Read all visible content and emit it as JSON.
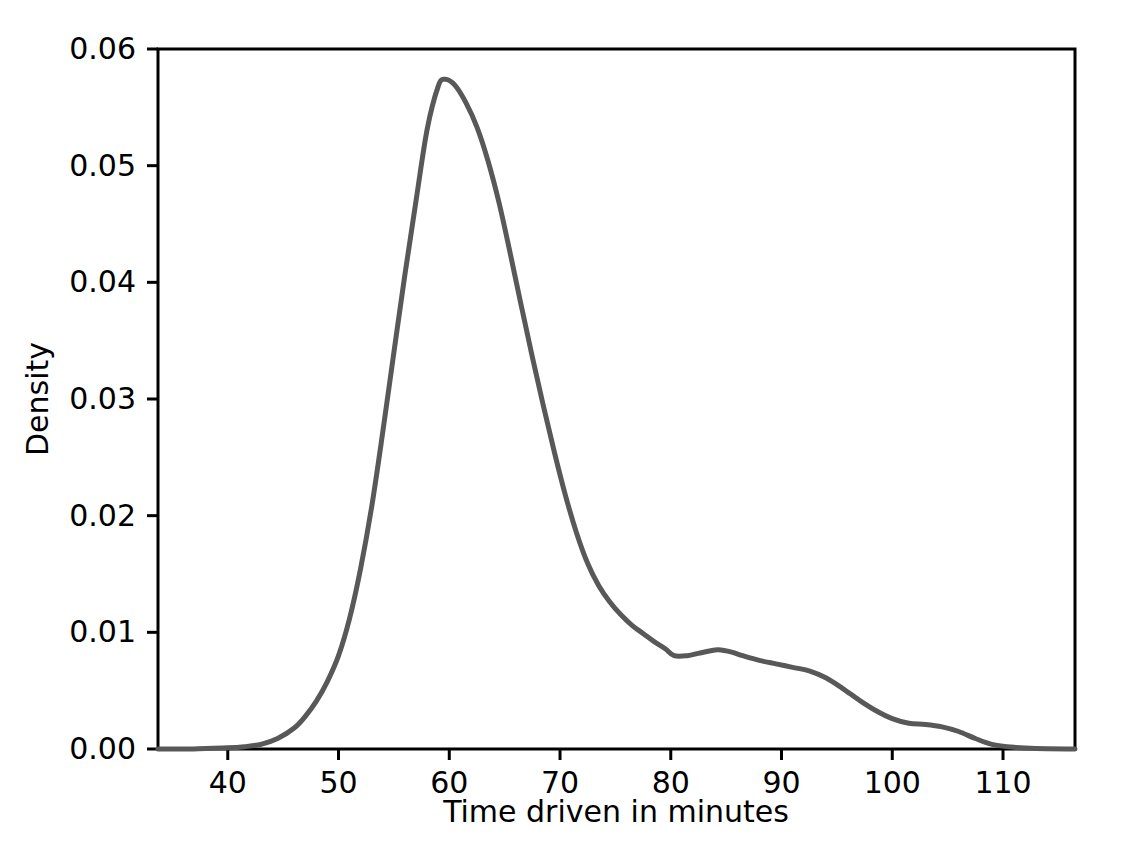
{
  "chart_data": {
    "type": "line",
    "title": "",
    "subtitle": "",
    "xlabel": "Time driven in minutes",
    "ylabel": "Density",
    "xlim": [
      33.7,
      116.5
    ],
    "ylim": [
      0.0,
      0.06
    ],
    "grid": false,
    "legend": null,
    "legend_position": "none",
    "xticks": [
      40,
      50,
      60,
      70,
      80,
      90,
      100,
      110
    ],
    "xticklabels": [
      "40",
      "50",
      "60",
      "70",
      "80",
      "90",
      "100",
      "110"
    ],
    "yticks": [
      0.0,
      0.01,
      0.02,
      0.03,
      0.04,
      0.05,
      0.06
    ],
    "yticklabels": [
      "0.00",
      "0.01",
      "0.02",
      "0.03",
      "0.04",
      "0.05",
      "0.06"
    ],
    "line_color": "#585858",
    "line_width": 5,
    "series": [
      {
        "name": "Density of time driven",
        "x": [
          33.7,
          36.0,
          38.0,
          40.0,
          41.5,
          43.0,
          44.5,
          46.0,
          47.0,
          48.0,
          49.0,
          50.0,
          51.0,
          52.0,
          53.0,
          54.0,
          55.0,
          56.0,
          57.0,
          58.0,
          59.0,
          59.6,
          60.5,
          61.5,
          62.5,
          63.5,
          64.5,
          65.5,
          66.5,
          67.5,
          68.5,
          69.5,
          70.5,
          71.5,
          72.5,
          73.5,
          74.5,
          75.5,
          76.5,
          77.5,
          78.5,
          79.5,
          80.3,
          81.5,
          82.5,
          83.5,
          84.3,
          85.5,
          86.5,
          88.0,
          89.5,
          91.0,
          92.5,
          94.0,
          95.5,
          97.0,
          98.5,
          100.0,
          101.5,
          103.0,
          104.5,
          106.0,
          107.5,
          109.0,
          111.0,
          113.0,
          116.5
        ],
        "y": [
          0.0,
          0.0,
          5e-05,
          0.0001,
          0.0002,
          0.0004,
          0.0009,
          0.0018,
          0.0028,
          0.0041,
          0.0058,
          0.008,
          0.0112,
          0.0155,
          0.0208,
          0.0272,
          0.034,
          0.0407,
          0.047,
          0.0531,
          0.0568,
          0.0574,
          0.0569,
          0.0554,
          0.0533,
          0.0504,
          0.0468,
          0.0425,
          0.038,
          0.0336,
          0.0294,
          0.0254,
          0.0217,
          0.0185,
          0.0159,
          0.014,
          0.0126,
          0.0115,
          0.0106,
          0.0099,
          0.0092,
          0.0086,
          0.008,
          0.008,
          0.0082,
          0.0084,
          0.0085,
          0.0083,
          0.008,
          0.0076,
          0.0073,
          0.007,
          0.0067,
          0.0061,
          0.0052,
          0.0042,
          0.0033,
          0.0026,
          0.0022,
          0.0021,
          0.0019,
          0.0015,
          0.0009,
          0.0004,
          0.00015,
          5e-05,
          0.0
        ],
        "peak": {
          "x": 59.6,
          "y": 0.0574
        },
        "secondary_bump": {
          "x": 84.3,
          "y": 0.0085
        },
        "local_minimum": {
          "x": 80.3,
          "y": 0.008
        }
      }
    ]
  },
  "axes": {
    "x_axis_label": "Time driven in minutes",
    "y_axis_label": "Density"
  }
}
